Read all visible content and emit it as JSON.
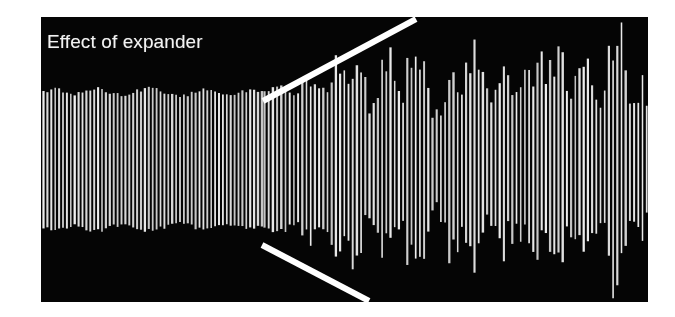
{
  "figure": {
    "caption": "Effect of expander",
    "panel": {
      "background_color": "#050505",
      "page_background_color": "#ffffff",
      "trace_color": "#f0f0f0",
      "marker_color": "#ffffff",
      "x": 41,
      "y": 17,
      "width": 607,
      "height": 285
    }
  },
  "chart_data": {
    "type": "line",
    "title": "Effect of expander",
    "subtitle": "",
    "xlabel": "",
    "ylabel": "",
    "grid": false,
    "legend_position": "none",
    "axis_visible": false,
    "xlim": [
      0,
      607
    ],
    "ylim": [
      -1,
      1
    ],
    "sections": [
      {
        "name": "before-expander",
        "x_start": 0,
        "x_end": 222,
        "envelope_top_y": 86,
        "envelope_bottom_y": 224,
        "envelope_amplitude_normalized": 0.48,
        "envelope_variation": 0.05,
        "stroke_spacing_px": 3.9,
        "description": "Flat, steady amplitude (compressed / pre-expansion)"
      },
      {
        "name": "after-expander",
        "x_start": 222,
        "x_end": 607,
        "envelope_top_y": 10,
        "envelope_bottom_y": 285,
        "envelope_amplitude_normalized": 0.97,
        "envelope_variation": 0.45,
        "stroke_spacing_px": 4.2,
        "description": "Large, highly variable amplitude (expanded dynamics)"
      }
    ],
    "markers": [
      {
        "name": "upper-expansion-guide",
        "type": "line",
        "x1": 222,
        "y1": 84,
        "x2": 375,
        "y2": 2,
        "color": "#ffffff",
        "width": 6
      },
      {
        "name": "lower-expansion-guide",
        "type": "line",
        "x1": 221,
        "y1": 228,
        "x2": 328,
        "y2": 284,
        "color": "#ffffff",
        "width": 6
      }
    ],
    "series": [
      {
        "name": "audio-waveform",
        "x": [
          0,
          222,
          607
        ],
        "values": [
          0.48,
          0.48,
          0.97
        ]
      }
    ],
    "left_envelope_profile": [
      0.47,
      0.5,
      0.48,
      0.46,
      0.49,
      0.5,
      0.47,
      0.45,
      0.48,
      0.5,
      0.49,
      0.46,
      0.44,
      0.47,
      0.5,
      0.48,
      0.45,
      0.47,
      0.49,
      0.47
    ],
    "right_envelope_profile": [
      0.62,
      0.82,
      0.7,
      0.95,
      0.78,
      0.58,
      0.9,
      1.0,
      0.72,
      0.86,
      0.64,
      0.98,
      0.8,
      0.55,
      0.88,
      0.93,
      0.68,
      0.76,
      0.99,
      0.84,
      0.6,
      0.92,
      0.74,
      0.87,
      0.96,
      0.66,
      0.81,
      0.94,
      0.7,
      0.89
    ]
  }
}
